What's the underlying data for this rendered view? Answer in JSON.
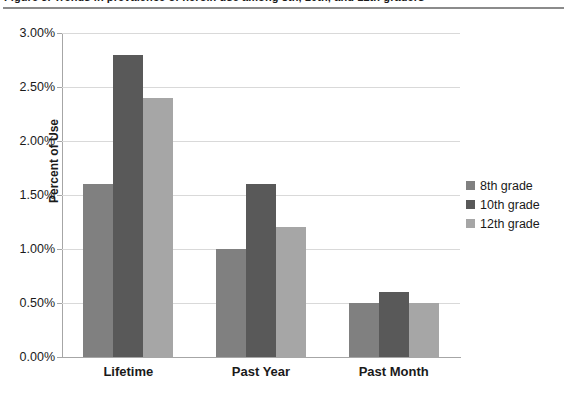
{
  "caption": {
    "text": "Figure 3.  Trends in prevalence of heroin use among 8th, 10th, and 12th graders"
  },
  "chart_data": {
    "type": "bar",
    "title": "",
    "xlabel": "",
    "ylabel": "Percent of Use",
    "categories": [
      "Lifetime",
      "Past Year",
      "Past Month"
    ],
    "series": [
      {
        "name": "8th grade",
        "color": "#808080",
        "values": [
          1.6,
          1.0,
          0.5
        ]
      },
      {
        "name": "10th grade",
        "color": "#595959",
        "values": [
          2.8,
          1.6,
          0.6
        ]
      },
      {
        "name": "12th grade",
        "color": "#A6A6A6",
        "values": [
          2.4,
          1.2,
          0.5
        ]
      }
    ],
    "ylim": [
      0,
      3.0
    ],
    "ytick_values": [
      0,
      0.5,
      1.0,
      1.5,
      2.0,
      2.5,
      3.0
    ],
    "ytick_labels": [
      "0.00%",
      "0.50%",
      "1.00%",
      "1.50%",
      "2.00%",
      "2.50%",
      "3.00%"
    ],
    "grid": true,
    "legend_position": "right"
  },
  "axis": {
    "y_title": "Percent of Use"
  },
  "colors": {
    "gridline": "#D9D9D9",
    "axis": "#A6A6A6",
    "text": "#1A1A1A",
    "rule": "#8B8B8B"
  }
}
